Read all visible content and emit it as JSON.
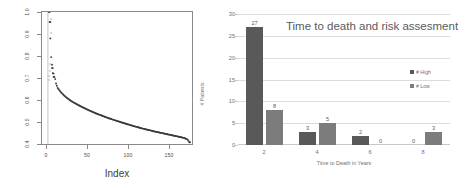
{
  "chart_data": [
    {
      "type": "scatter",
      "id": "left-scatter",
      "title": "",
      "xlabel": "Index",
      "ylabel": "",
      "xlim": [
        0,
        175
      ],
      "ylim": [
        0.4,
        1.0
      ],
      "xticks": [
        "0",
        "50",
        "100",
        "150"
      ],
      "xtick_values": [
        0,
        50,
        100,
        150
      ],
      "yticks": [
        "1.0",
        "0.9",
        "0.8",
        "0.7",
        "0.6",
        "0.5",
        "0.4"
      ],
      "ytick_values": [
        1.0,
        0.9,
        0.8,
        0.7,
        0.6,
        0.5,
        0.4
      ],
      "grid": false,
      "legend": "none",
      "point_color": "#3a3a3a",
      "description": "Sorted descending values forming a steep decay curve with a few isolated high outlier points near index 0",
      "x": [
        1,
        2,
        3,
        4,
        5,
        6,
        7,
        8,
        9,
        10,
        12,
        14,
        16,
        18,
        20,
        24,
        28,
        32,
        36,
        40,
        45,
        50,
        55,
        60,
        65,
        70,
        75,
        80,
        85,
        90,
        95,
        100,
        105,
        110,
        115,
        120,
        125,
        130,
        135,
        140,
        145,
        150,
        155,
        160,
        165,
        168,
        170,
        172,
        173,
        174
      ],
      "y": [
        1.0,
        0.955,
        0.88,
        0.795,
        0.76,
        0.745,
        0.72,
        0.705,
        0.695,
        0.675,
        0.655,
        0.645,
        0.635,
        0.628,
        0.62,
        0.608,
        0.597,
        0.588,
        0.58,
        0.572,
        0.563,
        0.554,
        0.546,
        0.538,
        0.531,
        0.524,
        0.517,
        0.511,
        0.505,
        0.499,
        0.493,
        0.488,
        0.482,
        0.477,
        0.472,
        0.467,
        0.463,
        0.458,
        0.454,
        0.45,
        0.446,
        0.442,
        0.438,
        0.434,
        0.43,
        0.427,
        0.424,
        0.42,
        0.415,
        0.408
      ],
      "outliers_x": [
        2,
        3,
        5,
        6,
        7
      ],
      "outliers_y": [
        1.0,
        0.955,
        0.745,
        0.722,
        0.705
      ]
    },
    {
      "type": "bar",
      "id": "right-bars",
      "title": "Time to death and risk assesment",
      "xlabel": "Time to Death in Years",
      "ylabel": "# Patients",
      "categories": [
        "2",
        "4",
        "6",
        "8"
      ],
      "yticks": [
        "0",
        "5",
        "10",
        "15",
        "20",
        "25",
        "30"
      ],
      "ytick_values": [
        0,
        5,
        10,
        15,
        20,
        25,
        30
      ],
      "ylim": [
        0,
        30
      ],
      "grid": true,
      "legend_position": "inside-right",
      "series": [
        {
          "name": "# High",
          "values": [
            27,
            3,
            2,
            0
          ],
          "color": "#595959"
        },
        {
          "name": "# Low",
          "values": [
            8,
            5,
            0,
            3
          ],
          "color": "#7c7c7c"
        }
      ]
    }
  ],
  "left": {
    "xlabel": "Index",
    "yticks": [
      "1.0",
      "0.9",
      "0.8",
      "0.7",
      "0.6",
      "0.5",
      "0.4"
    ],
    "xticks": [
      "0",
      "50",
      "100",
      "150"
    ],
    "inner_labels": [
      "0",
      "0",
      "0",
      "0",
      "0",
      "0"
    ]
  },
  "right": {
    "title": "Time to death and risk assesment",
    "xlabel": "Time to Death in Years",
    "ylabel": "# Patients",
    "yticks": [
      "30",
      "25",
      "20",
      "15",
      "10",
      "5",
      "0"
    ],
    "xticks": [
      "2",
      "4",
      "6",
      "8"
    ],
    "legend": [
      {
        "label": "# High",
        "color": "#595959"
      },
      {
        "label": "# Low",
        "color": "#7c7c7c"
      }
    ],
    "groups": [
      {
        "category": "2",
        "high": "27",
        "low": "8"
      },
      {
        "category": "4",
        "high": "3",
        "low": "5"
      },
      {
        "category": "6",
        "high": "2",
        "low": "0"
      },
      {
        "category": "8",
        "high": "0",
        "low": "3"
      }
    ]
  }
}
